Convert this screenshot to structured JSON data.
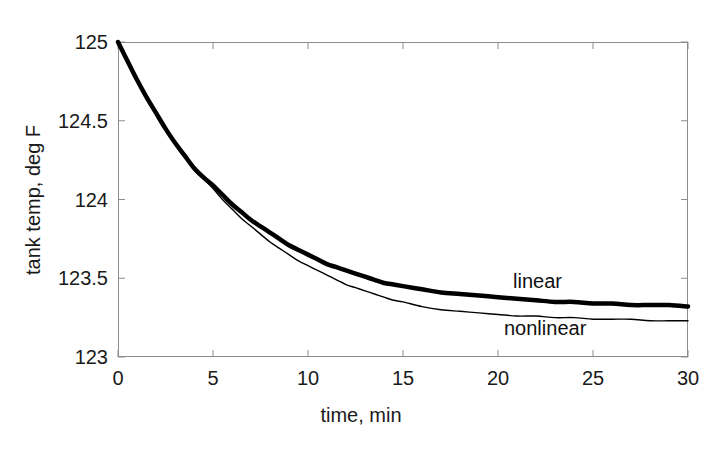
{
  "chart_data": {
    "type": "line",
    "title": "",
    "xlabel": "time, min",
    "ylabel": "tank temp, deg F",
    "xlim": [
      0,
      30
    ],
    "ylim": [
      123,
      125
    ],
    "xticks": [
      0,
      5,
      10,
      15,
      20,
      25,
      30
    ],
    "xtick_labels": [
      "0",
      "5",
      "10",
      "15",
      "20",
      "25",
      "30"
    ],
    "yticks": [
      123,
      123.5,
      124,
      124.5,
      125
    ],
    "ytick_labels": [
      "123",
      "123.5",
      "124",
      "124.5",
      "125"
    ],
    "grid": false,
    "legend_position": "inline-annotation",
    "annotations": [
      {
        "text": "linear",
        "x": 22.4,
        "y": 123.47
      },
      {
        "text": "nonlinear",
        "x": 21.9,
        "y": 123.17
      }
    ],
    "series": [
      {
        "name": "linear",
        "style": "thick-solid-black",
        "color": "#000000",
        "linewidth": 4.5,
        "x": [
          0,
          0.5,
          1,
          1.5,
          2,
          2.5,
          3,
          3.5,
          4,
          4.5,
          5,
          5.5,
          6,
          6.5,
          7,
          7.5,
          8,
          8.5,
          9,
          9.5,
          10,
          10.5,
          11,
          11.5,
          12,
          12.5,
          13,
          13.5,
          14,
          14.5,
          15,
          16,
          17,
          18,
          19,
          20,
          21,
          22,
          23,
          24,
          25,
          26,
          27,
          28,
          29,
          30
        ],
        "y": [
          125.0,
          124.88,
          124.76,
          124.65,
          124.55,
          124.45,
          124.36,
          124.28,
          124.2,
          124.14,
          124.09,
          124.03,
          123.97,
          123.92,
          123.87,
          123.83,
          123.79,
          123.75,
          123.71,
          123.68,
          123.65,
          123.62,
          123.59,
          123.57,
          123.55,
          123.53,
          123.51,
          123.49,
          123.47,
          123.46,
          123.45,
          123.43,
          123.41,
          123.4,
          123.39,
          123.38,
          123.37,
          123.36,
          123.35,
          123.35,
          123.34,
          123.34,
          123.33,
          123.33,
          123.33,
          123.32
        ]
      },
      {
        "name": "nonlinear",
        "style": "thin-solid-black",
        "color": "#000000",
        "linewidth": 1.4,
        "x": [
          0,
          0.5,
          1,
          1.5,
          2,
          2.5,
          3,
          3.5,
          4,
          4.5,
          5,
          5.5,
          6,
          6.5,
          7,
          7.5,
          8,
          8.5,
          9,
          9.5,
          10,
          10.5,
          11,
          11.5,
          12,
          12.5,
          13,
          13.5,
          14,
          14.5,
          15,
          16,
          17,
          18,
          19,
          20,
          21,
          22,
          23,
          24,
          25,
          26,
          27,
          28,
          29,
          30
        ],
        "y": [
          125.0,
          124.88,
          124.76,
          124.65,
          124.54,
          124.44,
          124.35,
          124.27,
          124.19,
          124.13,
          124.07,
          124.0,
          123.94,
          123.88,
          123.83,
          123.78,
          123.73,
          123.69,
          123.65,
          123.61,
          123.58,
          123.55,
          123.52,
          123.49,
          123.46,
          123.44,
          123.42,
          123.4,
          123.38,
          123.36,
          123.35,
          123.32,
          123.3,
          123.29,
          123.28,
          123.27,
          123.26,
          123.26,
          123.25,
          123.25,
          123.24,
          123.24,
          123.24,
          123.23,
          123.23,
          123.23
        ]
      }
    ]
  },
  "axes": {
    "frame_color": "#8c8c8c",
    "tick_color": "#8c8c8c"
  }
}
